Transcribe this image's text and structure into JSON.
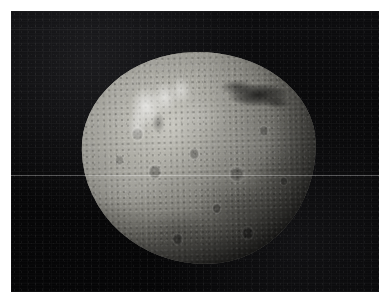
{
  "page": {
    "background_color": "#ffffff",
    "width": 392,
    "height": 306
  },
  "photo": {
    "subject": "asteroid",
    "subject_name": "Vesta",
    "alt_text": "Grayscale spacecraft photograph of the asteroid Vesta against black space",
    "background_color": "#050506",
    "surface_color": "#9a9a94",
    "highlight_color": "#d8d7d0",
    "shadow_color": "#33322f",
    "scanline_color": "#ffffff",
    "frame": {
      "left": 11,
      "top": 11,
      "width": 368,
      "height": 281
    },
    "body": {
      "left": 71,
      "top": 41,
      "width": 234,
      "height": 212
    },
    "features": [
      {
        "name": "bright-massif-cluster",
        "region": "upper-left"
      },
      {
        "name": "dark-shadow-streak",
        "region": "upper-right"
      },
      {
        "name": "grooved-terrain",
        "region": "north-limb"
      },
      {
        "name": "cratered-regolith",
        "region": "equatorial"
      },
      {
        "name": "terminator-shadow",
        "region": "lower-right"
      }
    ]
  }
}
